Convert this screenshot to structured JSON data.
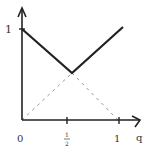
{
  "diagram": {
    "type": "piecewise-linear-plot",
    "axes": {
      "x_label": "q",
      "x_ticks": [
        {
          "value": 0,
          "label": "0"
        },
        {
          "value": 0.5,
          "label": "1/2"
        },
        {
          "value": 1,
          "label": "1"
        }
      ],
      "y_ticks": [
        {
          "value": 1,
          "label": "1"
        }
      ]
    },
    "solid_curve": {
      "description": "max(1-q, q)",
      "points": [
        [
          0,
          1
        ],
        [
          0.5,
          0.5
        ],
        [
          1,
          1
        ]
      ]
    },
    "dashed_lines": [
      {
        "description": "y = q",
        "points": [
          [
            0,
            0
          ],
          [
            0.5,
            0.5
          ]
        ]
      },
      {
        "description": "y = 1 - q",
        "points": [
          [
            0.5,
            0.5
          ],
          [
            1,
            0
          ]
        ]
      }
    ],
    "colors": {
      "axis": "#222222",
      "solid": "#222222",
      "dashed": "#999999"
    }
  },
  "labels": {
    "origin": "0",
    "half_num": "1",
    "half_den": "2",
    "x_one": "1",
    "x_axis": "q",
    "y_one": "1"
  }
}
